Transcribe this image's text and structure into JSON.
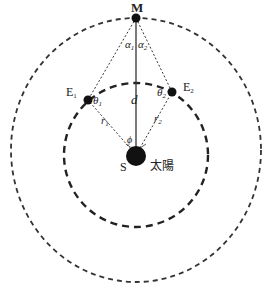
{
  "diagram": {
    "points": {
      "mars": "M",
      "earth1": "E",
      "earth1_sub": "1",
      "earth2": "E",
      "earth2_sub": "2",
      "sun": "S",
      "sun_name": "太陽"
    },
    "labels": {
      "alpha1": "α",
      "alpha1_sub": "1",
      "alpha2": "α",
      "alpha2_sub": "2",
      "theta1": "θ",
      "theta1_sub": "1",
      "theta2": "θ",
      "theta2_sub": "2",
      "d": "d",
      "r1": "r",
      "r1_sub": "1",
      "r2": "r",
      "r2_sub": "2",
      "phi": "ϕ"
    },
    "colors": {
      "stroke": "#333333",
      "fill": "#111111"
    }
  }
}
